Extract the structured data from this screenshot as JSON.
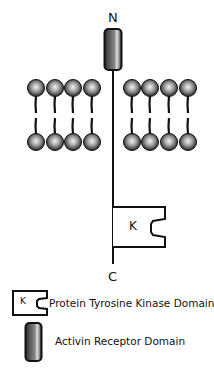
{
  "diagram": {
    "n_terminus_label": "N",
    "c_terminus_label": "C",
    "kinase_letter": "K",
    "membrane": {
      "left_lipids": 4,
      "right_lipids": 4
    },
    "colors": {
      "line": "#111111",
      "lipid_head_light": "#f2f2f2",
      "lipid_head_dark": "#222222",
      "cylinder_dark": "#3a3a3a",
      "cylinder_mid": "#7a7a7a",
      "cylinder_highlight": "#d8d8d8"
    }
  },
  "legend": {
    "items": [
      {
        "icon": "kinase-domain-icon",
        "letter": "K",
        "label": "Protein Tyrosine Kinase Domain"
      },
      {
        "icon": "activin-receptor-cylinder-icon",
        "label": "Activin Receptor Domain"
      }
    ]
  }
}
